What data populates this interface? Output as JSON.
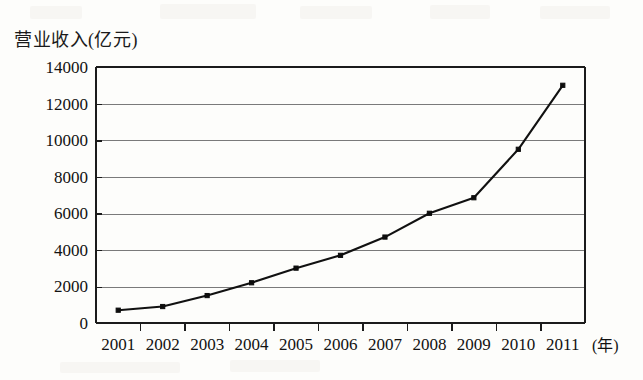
{
  "chart_data": {
    "type": "line",
    "title": "营业收入(亿元)",
    "xlabel": "(年)",
    "ylabel": "营业收入(亿元)",
    "categories": [
      "2001",
      "2002",
      "2003",
      "2004",
      "2005",
      "2006",
      "2007",
      "2008",
      "2009",
      "2010",
      "2011"
    ],
    "values": [
      700,
      900,
      1500,
      2200,
      3000,
      3700,
      4700,
      6000,
      6850,
      9500,
      13000
    ],
    "series": [
      {
        "name": "营业收入",
        "values": [
          700,
          900,
          1500,
          2200,
          3000,
          3700,
          4700,
          6000,
          6850,
          9500,
          13000
        ]
      }
    ],
    "ylim": [
      0,
      14000
    ],
    "ytick_step": 2000,
    "yticks": [
      "0",
      "2000",
      "4000",
      "6000",
      "8000",
      "10000",
      "12000",
      "14000"
    ],
    "ytick_values": [
      0,
      2000,
      4000,
      6000,
      8000,
      10000,
      12000,
      14000
    ],
    "xticks": [
      "2001",
      "2002",
      "2003",
      "2004",
      "2005",
      "2006",
      "2007",
      "2008",
      "2009",
      "2010",
      "2011"
    ],
    "grid": true,
    "grid_axis": "y",
    "legend": false,
    "legend_position": "none",
    "marker": "square",
    "line_color": "#111111",
    "marker_color": "#0d0d0d",
    "grid_color": "#7a7a7a",
    "axis_color": "#1b1b1b",
    "background_color": "#fdfdfb"
  },
  "layout": {
    "plot_left": 96,
    "plot_right": 585,
    "plot_top": 67,
    "plot_bottom": 323,
    "x_unit_label_x": 592,
    "x_unit_label_y": 351
  }
}
